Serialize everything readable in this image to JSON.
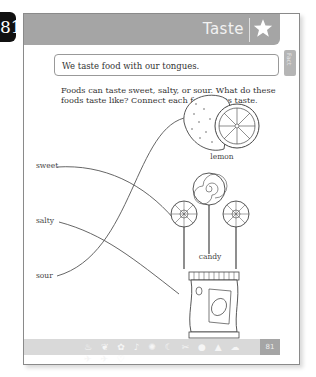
{
  "page_number_badge": "81",
  "header": {
    "title": "Taste",
    "icon": "star-icon"
  },
  "fact_box": {
    "text": "We taste food with our tongues."
  },
  "side_tab": {
    "label": "Fact"
  },
  "instructions": "Foods can taste sweet, salty, or sour. What do these foods taste like? Connect each food to its taste.",
  "tastes": [
    {
      "label": "sweet"
    },
    {
      "label": "salty"
    },
    {
      "label": "sour"
    }
  ],
  "foods": [
    {
      "label": "lemon",
      "icon": "lemon-icon"
    },
    {
      "label": "candy",
      "icon": "lollipop-icon"
    },
    {
      "label": "potato chips",
      "icon": "chips-bag-icon"
    }
  ],
  "connections": [
    {
      "from": "sweet",
      "to": "candy"
    },
    {
      "from": "salty",
      "to": "potato chips"
    },
    {
      "from": "sour",
      "to": "lemon"
    }
  ],
  "footer": {
    "page_number": "81",
    "icons": "♨ ❦ ✿ ♪ ✺ ☾ ✂ ● ▲ ☁ ✈ ✈ ♡"
  }
}
